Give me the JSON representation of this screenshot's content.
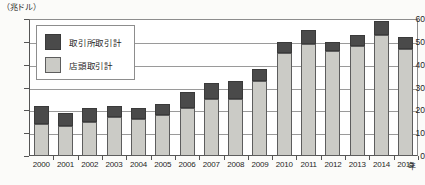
{
  "chart_data": {
    "type": "bar",
    "stacked": true,
    "title": "",
    "subtitle": "",
    "unit_label": "（兆ドル）",
    "xlabel": "年",
    "ylabel": "",
    "ylim": [
      0,
      60
    ],
    "ytick_step": 10,
    "ytick_labels": [
      "60",
      "50",
      "40",
      "30",
      "20",
      "10",
      "0"
    ],
    "ytick_values": [
      60,
      50,
      40,
      30,
      20,
      10,
      0
    ],
    "grid": true,
    "grid_axis": "y",
    "legend_position": "upper-left-inside",
    "categories": [
      "2000",
      "2001",
      "2002",
      "2003",
      "2004",
      "2005",
      "2006",
      "2007",
      "2008",
      "2009",
      "2010",
      "2011",
      "2012",
      "2013",
      "2014",
      "2015"
    ],
    "series": [
      {
        "name": "店頭取引計",
        "color": "#cbcbc6",
        "stack_order": 0,
        "values": [
          14,
          13,
          15,
          17,
          16,
          18,
          21,
          25,
          25,
          33,
          45,
          49,
          46,
          48,
          53,
          47
        ]
      },
      {
        "name": "取引所取引計",
        "color": "#4a4a4a",
        "stack_order": 1,
        "values": [
          8,
          6,
          6,
          5,
          5,
          5,
          7,
          7,
          8,
          5,
          5,
          6,
          4,
          5,
          6,
          5
        ]
      }
    ],
    "totals": [
      22,
      19,
      21,
      22,
      21,
      23,
      28,
      32,
      33,
      38,
      50,
      55,
      50,
      53,
      59,
      52
    ]
  },
  "legend": {
    "items": [
      {
        "label": "取引所取引計",
        "swatch": "dark"
      },
      {
        "label": "店頭取引計",
        "swatch": "light"
      }
    ]
  },
  "colors": {
    "exchange": "#4a4a4a",
    "otc": "#cbcbc6",
    "grid": "#9a9a9a",
    "axis": "#555555",
    "text": "#1f1f1f",
    "background": "#ffffff"
  }
}
